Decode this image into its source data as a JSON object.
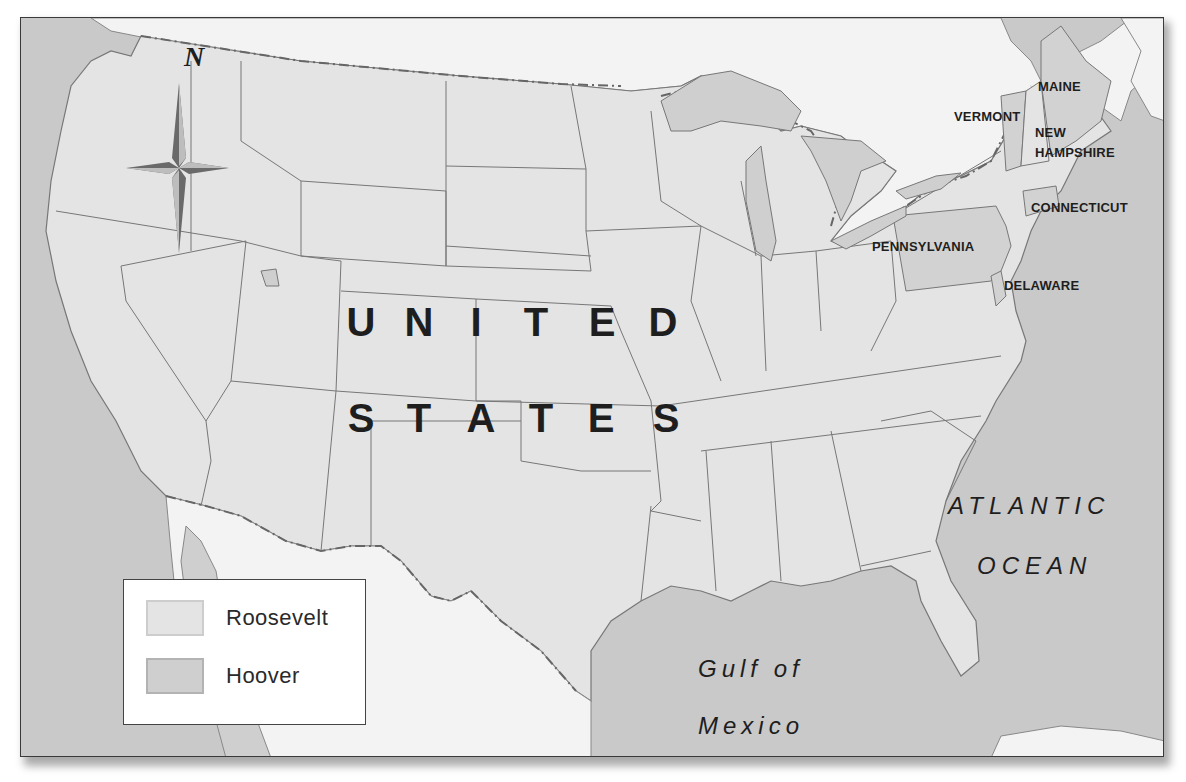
{
  "map": {
    "colors": {
      "ocean": "#c9c9c9",
      "us_land_roosevelt": "#e4e4e4",
      "us_land_hoover": "#d2d2d2",
      "foreign_land": "#f3f3f3",
      "lakes": "#cfcfcf",
      "borders": "#777777"
    },
    "compass": {
      "north_label": "N"
    },
    "country_label": {
      "line1": [
        "U",
        "N",
        "I",
        "T",
        "E",
        "D"
      ],
      "line2": [
        "S",
        "T",
        "A",
        "T",
        "E",
        "S"
      ]
    },
    "water_labels": {
      "atlantic_line1": "ATLANTIC",
      "atlantic_line2": "OCEAN",
      "gulf_line1": "Gulf of",
      "gulf_line2": "Mexico"
    },
    "state_labels": {
      "maine": "MAINE",
      "vermont": "VERMONT",
      "new_hampshire_line1": "NEW",
      "new_hampshire_line2": "HAMPSHIRE",
      "connecticut": "CONNECTICUT",
      "pennsylvania": "PENNSYLVANIA",
      "delaware": "DELAWARE"
    },
    "legend": {
      "items": [
        {
          "label": "Roosevelt",
          "color": "#e4e4e4"
        },
        {
          "label": "Hoover",
          "color": "#cfcfcf"
        }
      ]
    },
    "hoover_states": [
      "Maine",
      "Vermont",
      "New Hampshire",
      "Connecticut",
      "Pennsylvania",
      "Delaware"
    ]
  }
}
